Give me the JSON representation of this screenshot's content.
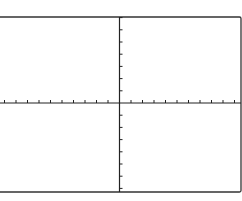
{
  "figure": {
    "type": "coordinate-plane",
    "colors": {
      "background": "#ffffff",
      "axis": "#222222",
      "frame": "#333333"
    },
    "frame": {
      "top": 17,
      "bottom": 192,
      "left": -2,
      "right": 241
    },
    "origin": {
      "x": 119.5,
      "y": 103
    },
    "x_axis": {
      "ticks_left": 10,
      "ticks_right": 10,
      "tick_spacing": 11.5
    },
    "y_axis": {
      "ticks_up": 7,
      "ticks_down": 7,
      "tick_spacing": 12.2
    }
  }
}
